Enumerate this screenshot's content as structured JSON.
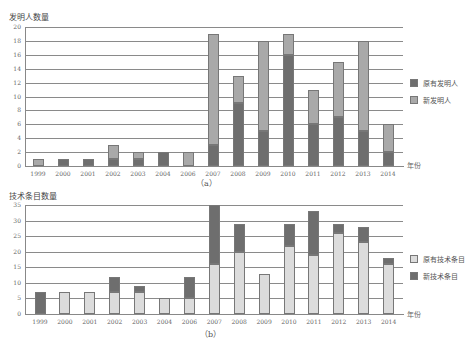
{
  "colors": {
    "dark": "#6e6e6e",
    "medium": "#a9a9a9",
    "light": "#dcdcdc"
  },
  "chart_data": [
    {
      "type": "bar",
      "stacked": true,
      "title": "发明人数量",
      "caption": "（a）",
      "xlabel": "年份",
      "ylabel": "发明人数量",
      "ylim": [
        0,
        20
      ],
      "yticks": [
        0,
        2,
        4,
        6,
        8,
        10,
        12,
        14,
        16,
        18,
        20
      ],
      "grid": true,
      "legend_position": "right",
      "categories": [
        "1999",
        "2000",
        "2001",
        "2002",
        "2003",
        "2004",
        "2006",
        "2007",
        "2008",
        "2009",
        "2010",
        "2011",
        "2012",
        "2013",
        "2014"
      ],
      "series": [
        {
          "name": "原有发明人",
          "color": "#6e6e6e",
          "values": [
            0,
            1,
            1,
            1,
            1,
            2,
            0,
            3,
            9,
            5,
            16,
            6,
            7,
            5,
            2
          ]
        },
        {
          "name": "新发明人",
          "color": "#a9a9a9",
          "values": [
            1,
            0,
            0,
            2,
            1,
            0,
            2,
            16,
            4,
            13,
            3,
            5,
            8,
            13,
            4
          ]
        }
      ]
    },
    {
      "type": "bar",
      "stacked": true,
      "title": "技术条目数量",
      "caption": "（b）",
      "xlabel": "年份",
      "ylabel": "技术条目数量",
      "ylim": [
        0,
        35
      ],
      "yticks": [
        0,
        5,
        10,
        15,
        20,
        25,
        30,
        35
      ],
      "grid": true,
      "legend_position": "right",
      "categories": [
        "1999",
        "2000",
        "2001",
        "2002",
        "2003",
        "2004",
        "2006",
        "2007",
        "2008",
        "2009",
        "2010",
        "2011",
        "2012",
        "2013",
        "2014"
      ],
      "series": [
        {
          "name": "原有技术条目",
          "color": "#dcdcdc",
          "values": [
            0,
            7,
            7,
            7,
            7,
            5,
            5,
            16,
            20,
            13,
            22,
            19,
            26,
            23,
            16
          ]
        },
        {
          "name": "新技术条目",
          "color": "#6e6e6e",
          "values": [
            7,
            0,
            0,
            5,
            2,
            0,
            7,
            19,
            9,
            0,
            7,
            14,
            3,
            5,
            2
          ]
        }
      ]
    }
  ]
}
